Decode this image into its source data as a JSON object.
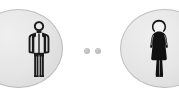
{
  "scene": {
    "title": "Two person icons connected by dots",
    "background_color": "#ffffff",
    "width": 179,
    "height": 104
  },
  "nodes": [
    {
      "id": "left-node",
      "label": "Male person",
      "icon": "male-person-icon",
      "circle_fill": "#e6e6e6",
      "circle_edge": "#a0a0a0",
      "figure_color": "#1a1a1a",
      "clipped_edge": "left"
    },
    {
      "id": "right-node",
      "label": "Female person",
      "icon": "female-person-icon",
      "circle_fill": "#e6e6e6",
      "circle_edge": "#a0a0a0",
      "figure_color": "#111111",
      "clipped_edge": "right"
    }
  ],
  "connector": {
    "label": "Connection dots",
    "dot_count": 2,
    "dot_color": "#bdbdbd",
    "dots": [
      {
        "id": "dot-1",
        "label": "dot"
      },
      {
        "id": "dot-2",
        "label": "dot"
      }
    ]
  }
}
